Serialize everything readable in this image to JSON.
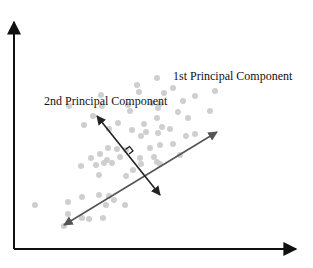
{
  "diagram": {
    "labels": {
      "pc1": "1st Principal Component",
      "pc2": "2nd Principal Component"
    },
    "colors": {
      "axis": "#111111",
      "pc1_arrow": "#555555",
      "pc2_arrow": "#222222",
      "points": "#cfcfcf"
    },
    "axes": {
      "origin": [
        14,
        249
      ],
      "y_tip": [
        14,
        20
      ],
      "x_tip": [
        298,
        249
      ]
    },
    "pc1": {
      "from": [
        64,
        225
      ],
      "to": [
        217,
        132
      ]
    },
    "pc2": {
      "from": [
        97,
        116
      ],
      "to": [
        160,
        195
      ]
    },
    "points": [
      [
        137,
        85
      ],
      [
        157,
        78
      ],
      [
        173,
        88
      ],
      [
        215,
        91
      ],
      [
        101,
        95
      ],
      [
        139,
        92
      ],
      [
        164,
        93
      ],
      [
        195,
        96
      ],
      [
        152,
        103
      ],
      [
        160,
        104
      ],
      [
        183,
        101
      ],
      [
        69,
        106
      ],
      [
        102,
        106
      ],
      [
        128,
        105
      ],
      [
        158,
        108
      ],
      [
        178,
        112
      ],
      [
        93,
        116
      ],
      [
        130,
        111
      ],
      [
        210,
        111
      ],
      [
        157,
        118
      ],
      [
        188,
        118
      ],
      [
        118,
        123
      ],
      [
        144,
        124
      ],
      [
        162,
        127
      ],
      [
        84,
        125
      ],
      [
        109,
        129
      ],
      [
        132,
        130
      ],
      [
        170,
        129
      ],
      [
        146,
        132
      ],
      [
        141,
        136
      ],
      [
        158,
        133
      ],
      [
        195,
        134
      ],
      [
        117,
        149
      ],
      [
        108,
        148
      ],
      [
        150,
        148
      ],
      [
        173,
        144
      ],
      [
        186,
        136
      ],
      [
        100,
        154
      ],
      [
        126,
        150
      ],
      [
        160,
        145
      ],
      [
        154,
        157
      ],
      [
        91,
        158
      ],
      [
        107,
        160
      ],
      [
        120,
        157
      ],
      [
        140,
        158
      ],
      [
        157,
        162
      ],
      [
        180,
        155
      ],
      [
        133,
        170
      ],
      [
        112,
        163
      ],
      [
        96,
        165
      ],
      [
        104,
        163
      ],
      [
        81,
        166
      ],
      [
        99,
        175
      ],
      [
        126,
        176
      ],
      [
        160,
        164
      ],
      [
        141,
        164
      ],
      [
        35,
        205
      ],
      [
        68,
        214
      ],
      [
        82,
        218
      ],
      [
        89,
        219
      ],
      [
        103,
        218
      ],
      [
        64,
        226
      ],
      [
        106,
        205
      ],
      [
        125,
        205
      ],
      [
        114,
        200
      ],
      [
        109,
        196
      ],
      [
        99,
        195
      ],
      [
        82,
        197
      ],
      [
        68,
        202
      ]
    ]
  }
}
